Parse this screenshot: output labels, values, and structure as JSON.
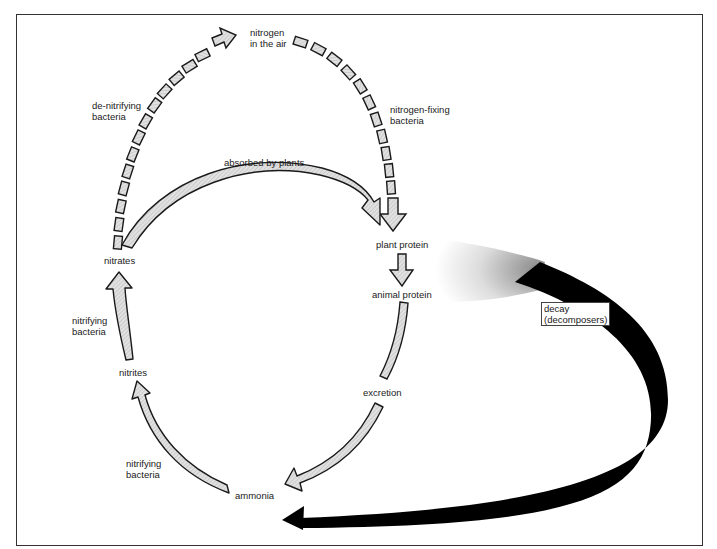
{
  "diagram": {
    "colors": {
      "arrow_fill": "#d6d6d6",
      "arrow_stroke": "#1a1a1a",
      "decay_fill": "#000000",
      "frame": "#333333"
    },
    "nodes": {
      "nitrogen_air": [
        "nitrogen",
        "in the air"
      ],
      "plant_protein": "plant protein",
      "animal_protein": "animal protein",
      "excretion": "excretion",
      "ammonia": "ammonia",
      "nitrites": "nitrites",
      "nitrates": "nitrates"
    },
    "edge_labels": {
      "denitrifying": [
        "de-nitrifying",
        "bacteria"
      ],
      "nitrogen_fixing": [
        "nitrogen-fixing",
        "bacteria"
      ],
      "absorbed": "absorbed by plants",
      "nitrifying_upper": [
        "nitrifying",
        "bacteria"
      ],
      "nitrifying_lower": [
        "nitrifying",
        "bacteria"
      ],
      "decay": [
        "decay",
        "(decomposers)"
      ]
    },
    "edges": [
      {
        "from": "nitrates",
        "to": "nitrogen in the air",
        "style": "dashed",
        "label": "de-nitrifying bacteria"
      },
      {
        "from": "nitrogen in the air",
        "to": "plant protein",
        "style": "dashed",
        "label": "nitrogen-fixing bacteria"
      },
      {
        "from": "nitrates",
        "to": "plant protein",
        "style": "solid",
        "label": "absorbed by plants"
      },
      {
        "from": "plant protein",
        "to": "animal protein",
        "style": "solid",
        "label": ""
      },
      {
        "from": "animal protein",
        "to": "ammonia",
        "style": "solid",
        "label": "excretion"
      },
      {
        "from": "ammonia",
        "to": "nitrites",
        "style": "solid",
        "label": "nitrifying bacteria"
      },
      {
        "from": "nitrites",
        "to": "nitrates",
        "style": "solid",
        "label": "nitrifying bacteria"
      },
      {
        "from": "plant/animal protein",
        "to": "ammonia",
        "style": "black",
        "label": "decay (decomposers)"
      }
    ]
  }
}
